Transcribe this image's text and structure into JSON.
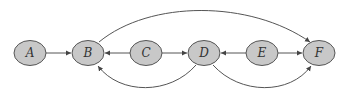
{
  "diagram": {
    "colors": {
      "node_fill": "#c8c8c8",
      "node_stroke": "#555555",
      "edge": "#555555"
    },
    "nodes": [
      {
        "id": "A",
        "label": "A",
        "cx": 30,
        "cy": 53
      },
      {
        "id": "B",
        "label": "B",
        "cx": 88,
        "cy": 53
      },
      {
        "id": "C",
        "label": "C",
        "cx": 146,
        "cy": 53
      },
      {
        "id": "D",
        "label": "D",
        "cx": 204,
        "cy": 53
      },
      {
        "id": "E",
        "label": "E",
        "cx": 262,
        "cy": 53
      },
      {
        "id": "F",
        "label": "F",
        "cx": 319,
        "cy": 53
      }
    ],
    "edges": [
      {
        "from": "A",
        "to": "B"
      },
      {
        "from": "C",
        "to": "B"
      },
      {
        "from": "C",
        "to": "D"
      },
      {
        "from": "E",
        "to": "D"
      },
      {
        "from": "E",
        "to": "F"
      },
      {
        "from": "B",
        "to": "F",
        "curve": "top"
      },
      {
        "from": "D",
        "to": "B",
        "curve": "bottom"
      },
      {
        "from": "D",
        "to": "F",
        "curve": "bottom"
      }
    ]
  }
}
